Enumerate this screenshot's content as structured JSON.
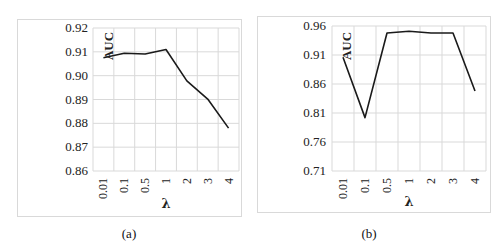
{
  "chart_data": [
    {
      "type": "line",
      "caption": "(a)",
      "categories": [
        "0.01",
        "0.1",
        "0.5",
        "1",
        "2",
        "3",
        "4"
      ],
      "series": [
        {
          "name": "AUC",
          "values": [
            0.9075,
            0.9094,
            0.9091,
            0.911,
            0.8978,
            0.8902,
            0.878
          ]
        }
      ],
      "xlabel": "λ",
      "ylabel": "AUC",
      "yticks": [
        "0.86",
        "0.87",
        "0.88",
        "0.89",
        "0.90",
        "0.91",
        "0.92"
      ],
      "ylim": [
        0.86,
        0.92
      ],
      "grid": true,
      "line_color": "#1a1a1a"
    },
    {
      "type": "line",
      "caption": "(b)",
      "categories": [
        "0.01",
        "0.1",
        "0.5",
        "1",
        "2",
        "3",
        "4"
      ],
      "series": [
        {
          "name": "AUC",
          "values": [
            0.906,
            0.802,
            0.948,
            0.951,
            0.948,
            0.948,
            0.848
          ]
        }
      ],
      "xlabel": "λ",
      "ylabel": "AUC",
      "yticks": [
        "0.71",
        "0.76",
        "0.81",
        "0.86",
        "0.91",
        "0.96"
      ],
      "ylim": [
        0.71,
        0.96
      ],
      "grid": true,
      "line_color": "#1a1a1a"
    }
  ]
}
